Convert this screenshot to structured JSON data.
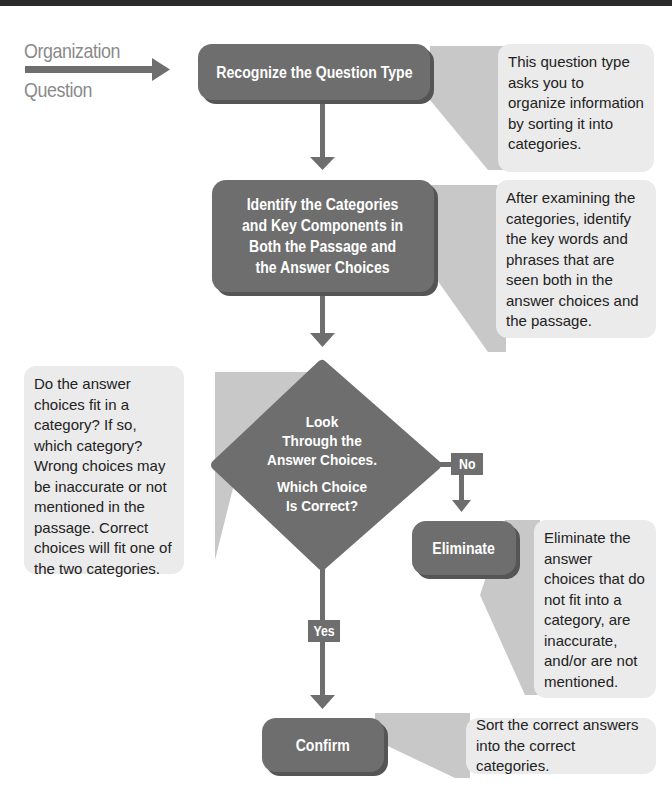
{
  "diagram": {
    "entry_label": [
      "Organization",
      "Question"
    ],
    "steps": {
      "recognize": {
        "label": "Recognize the Question Type",
        "note": "This question type asks you to organize information by sorting it into categories."
      },
      "identify": {
        "label": [
          "Identify the Categories",
          "and Key Components in",
          "Both the Passage and",
          "the Answer Choices"
        ],
        "note": "After examining the categories, identify the key words and phrases that are seen both in the answer choices and the passage."
      },
      "decision": {
        "label": [
          "Look",
          "Through the",
          "Answer Choices."
        ],
        "label2": [
          "Which Choice",
          "Is Correct?"
        ],
        "note": "Do the answer choices fit in a category? If so, which category? Wrong choices may be inaccurate or not mentioned in the passage. Correct choices will fit one of the two categories."
      },
      "eliminate": {
        "label": "Eliminate",
        "note": "Eliminate the answer choices that do not fit into a category, are inaccurate, and/or are not mentioned."
      },
      "confirm": {
        "label": "Confirm",
        "note": "Sort the correct answers into the correct categories."
      }
    },
    "branches": {
      "no": "No",
      "yes": "Yes"
    },
    "colors": {
      "box": "#6e6e6e",
      "note": "#ebebeb",
      "callout": "#c8c8c8",
      "arrow": "#6e6e6e",
      "label": "#8a8a8a"
    }
  }
}
